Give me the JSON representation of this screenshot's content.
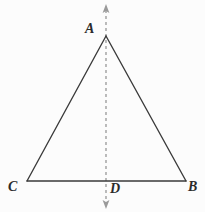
{
  "figure": {
    "background_color": "#fcfcfc",
    "stroke_color": "#3a3a3a",
    "dash_color": "#8a8a8a",
    "label_color": "#2b2b2b",
    "labels": {
      "apex": "A",
      "right_base": "B",
      "left_base": "C",
      "foot_of_altitude": "D"
    },
    "points": {
      "A": {
        "x": 106,
        "y": 36
      },
      "B": {
        "x": 186,
        "y": 181
      },
      "C": {
        "x": 27,
        "y": 181
      },
      "D": {
        "x": 106,
        "y": 181
      }
    },
    "symmetry_axis": {
      "x": 106,
      "y_top": 5,
      "y_bottom": 208,
      "style": "dashed",
      "arrow_top": true,
      "arrow_bottom": true
    },
    "segments": [
      {
        "name": "side-AC",
        "from": "A",
        "to": "C"
      },
      {
        "name": "side-AB",
        "from": "A",
        "to": "B"
      },
      {
        "name": "base-CB",
        "from": "C",
        "to": "B"
      }
    ]
  }
}
